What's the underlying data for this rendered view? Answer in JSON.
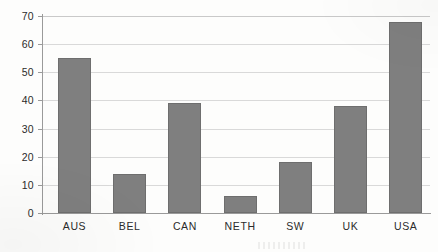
{
  "chart_data": {
    "type": "bar",
    "title": "",
    "subtitle": "",
    "xlabel": "",
    "ylabel": "",
    "categories": [
      "AUS",
      "BEL",
      "CAN",
      "NETH",
      "SW",
      "UK",
      "USA"
    ],
    "values": [
      55,
      14,
      39,
      6,
      18,
      38,
      68
    ],
    "series": [
      {
        "name": "",
        "values": [
          55,
          14,
          39,
          6,
          18,
          38,
          68
        ]
      }
    ],
    "ylim": [
      0,
      70
    ],
    "ytick_labels": [
      "70",
      "60",
      "50",
      "40",
      "30",
      "20",
      "10",
      "0"
    ],
    "ytick_values": [
      70,
      60,
      50,
      40,
      30,
      20,
      10,
      0
    ],
    "ytick_interval": 10,
    "grid": {
      "horizontal": true,
      "vertical": false
    },
    "legend": {
      "visible": false,
      "position": "none",
      "entries": []
    },
    "annotations": [],
    "data_labels": {
      "visible": false
    },
    "colors": {
      "bar_fill": "#7f7f7f",
      "bar_border": "#6e6e6e",
      "gridline": "#d9d9d9",
      "axis_line": "#9a9a9a",
      "tick_text": "#2b2b2b",
      "background": "#fdfdfc"
    }
  }
}
